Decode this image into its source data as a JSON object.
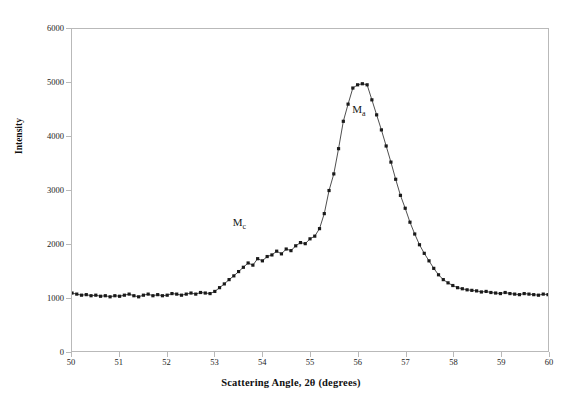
{
  "chart_data": {
    "type": "line",
    "title": "",
    "xlabel": "Scattering Angle, 2θ (degrees)",
    "ylabel": "Intensity",
    "xlim": [
      50,
      60
    ],
    "ylim": [
      0,
      6000
    ],
    "xticks": [
      50,
      51,
      52,
      53,
      54,
      55,
      56,
      57,
      58,
      59,
      60
    ],
    "yticks": [
      0,
      1000,
      2000,
      3000,
      4000,
      5000,
      6000
    ],
    "grid": false,
    "legend": null,
    "marker": "square",
    "marker_color": "#1a1a1a",
    "line_color": "#3a3a3a",
    "annotations": [
      {
        "text": "Ma",
        "label_main": "M",
        "label_sub": "a",
        "x": 56.05,
        "y": 4470
      },
      {
        "text": "Mc",
        "label_main": "M",
        "label_sub": "c",
        "x": 53.55,
        "y": 2370
      }
    ],
    "series": [
      {
        "name": "Diffraction intensity",
        "x": [
          50.0,
          50.1,
          50.2,
          50.3,
          50.4,
          50.5,
          50.6,
          50.7,
          50.8,
          50.9,
          51.0,
          51.1,
          51.2,
          51.3,
          51.4,
          51.5,
          51.6,
          51.7,
          51.8,
          51.9,
          52.0,
          52.1,
          52.2,
          52.3,
          52.4,
          52.5,
          52.6,
          52.7,
          52.8,
          52.9,
          53.0,
          53.1,
          53.2,
          53.3,
          53.4,
          53.5,
          53.6,
          53.7,
          53.8,
          53.9,
          54.0,
          54.1,
          54.2,
          54.3,
          54.4,
          54.5,
          54.6,
          54.7,
          54.8,
          54.9,
          55.0,
          55.1,
          55.2,
          55.3,
          55.4,
          55.5,
          55.6,
          55.7,
          55.8,
          55.9,
          56.0,
          56.1,
          56.2,
          56.3,
          56.4,
          56.5,
          56.6,
          56.7,
          56.8,
          56.9,
          57.0,
          57.1,
          57.2,
          57.3,
          57.4,
          57.5,
          57.6,
          57.7,
          57.8,
          57.9,
          58.0,
          58.1,
          58.2,
          58.3,
          58.4,
          58.5,
          58.6,
          58.7,
          58.8,
          58.9,
          59.0,
          59.1,
          59.2,
          59.3,
          59.4,
          59.5,
          59.6,
          59.7,
          59.8,
          59.9,
          60.0
        ],
        "y": [
          1080,
          1060,
          1040,
          1050,
          1030,
          1040,
          1020,
          1030,
          1010,
          1030,
          1020,
          1040,
          1060,
          1030,
          1010,
          1040,
          1060,
          1030,
          1050,
          1030,
          1040,
          1070,
          1060,
          1040,
          1060,
          1080,
          1060,
          1090,
          1080,
          1070,
          1110,
          1180,
          1250,
          1330,
          1400,
          1480,
          1560,
          1640,
          1600,
          1720,
          1680,
          1760,
          1790,
          1860,
          1810,
          1900,
          1870,
          1960,
          2020,
          2000,
          2090,
          2140,
          2280,
          2560,
          2990,
          3300,
          3770,
          4280,
          4600,
          4900,
          4960,
          4980,
          4960,
          4680,
          4400,
          4120,
          3820,
          3520,
          3200,
          2900,
          2660,
          2400,
          2180,
          1980,
          1820,
          1680,
          1540,
          1420,
          1330,
          1270,
          1220,
          1180,
          1160,
          1140,
          1130,
          1120,
          1100,
          1110,
          1090,
          1080,
          1070,
          1090,
          1070,
          1060,
          1050,
          1070,
          1060,
          1050,
          1040,
          1060,
          1050
        ]
      }
    ]
  }
}
